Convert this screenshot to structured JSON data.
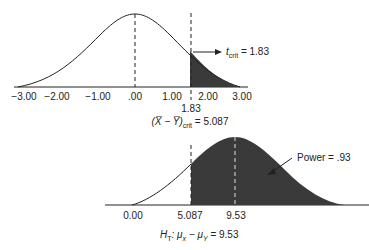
{
  "top_chart": {
    "ticks": [
      "−3.00",
      "−2.00",
      "−1.00",
      ".00",
      "1.00",
      "2.00",
      "3.00"
    ],
    "crit_tick": "1.83",
    "annotation_t": "t",
    "annotation_sub": "crit",
    "annotation_value": "= 1.83",
    "caption_expr": "(X̅ − Y̅)",
    "caption_sub": "crit",
    "caption_value": "= 5.087"
  },
  "bottom_chart": {
    "ticks": [
      "0.00",
      "5.087",
      "9.53"
    ],
    "power_label": "Power = .93",
    "caption_h": "H",
    "caption_h_sub": "T",
    "caption_expr": ": μ",
    "caption_x": "x",
    "caption_minus": " − μ",
    "caption_y": "Y",
    "caption_value": " = 9.53"
  },
  "colors": {
    "shade": "#3a3a3a",
    "line": "#222222"
  }
}
